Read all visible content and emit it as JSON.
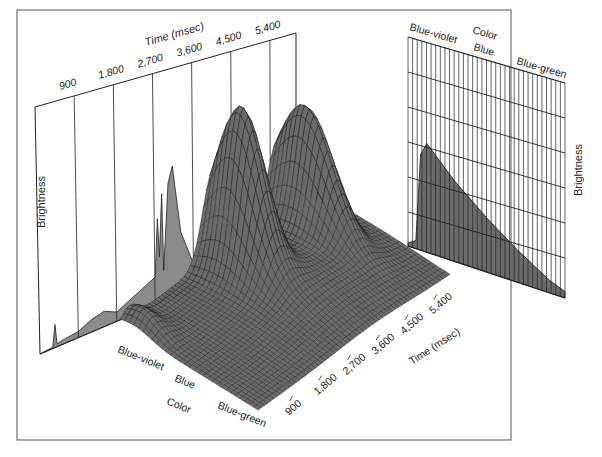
{
  "figure": {
    "frame": {
      "x": 17,
      "y": 10,
      "width": 494,
      "height": 430,
      "stroke": "#555555"
    },
    "colors": {
      "fill": "#8a8a8a",
      "mesh_fill": "#6b6b6b",
      "line": "#222222",
      "background": "#ffffff"
    }
  },
  "chart_data": [
    {
      "type": "area",
      "name": "time-projection",
      "title": "",
      "xlabel": "Time (msec)",
      "ylabel": "Brightness",
      "x_ticks": [
        "900",
        "1,800",
        "2,700",
        "3,600",
        "4,500",
        "5,400"
      ],
      "xlim": [
        0,
        6000
      ],
      "grid": "vertical lines at ticks",
      "x": [
        0,
        300,
        350,
        400,
        600,
        900,
        1200,
        1500,
        1800,
        2100,
        2400,
        2700,
        2750,
        2800,
        2850,
        2900,
        3000,
        3100,
        3300,
        3600,
        3800,
        4000,
        4200,
        4300,
        4400,
        4600,
        4800,
        4900,
        5000,
        5100,
        5200,
        5400,
        5600,
        5800,
        6000
      ],
      "values": [
        0,
        1,
        15,
        2,
        3,
        4,
        8,
        10,
        6,
        10,
        14,
        18,
        55,
        30,
        70,
        20,
        75,
        85,
        40,
        16,
        18,
        30,
        28,
        35,
        18,
        22,
        60,
        85,
        70,
        40,
        48,
        38,
        30,
        26,
        28
      ]
    },
    {
      "type": "area",
      "name": "color-projection",
      "title": "",
      "xlabel": "Color",
      "ylabel": "Brightness",
      "x_ticks": [
        "Blue-violet",
        "Blue",
        "Blue-green"
      ],
      "grid": "dense vertical + horizontal",
      "x": [
        0,
        0.05,
        0.08,
        0.12,
        0.2,
        0.3,
        0.4,
        0.5,
        0.6,
        0.7,
        0.8,
        0.9,
        1.0
      ],
      "values": [
        2,
        5,
        60,
        68,
        60,
        50,
        42,
        34,
        27,
        20,
        14,
        8,
        4
      ]
    },
    {
      "type": "surface",
      "name": "3d-surface",
      "title": "",
      "xlabel": "Time (msec)",
      "ylabel": "Color",
      "zlabel": "Brightness",
      "x_ticks": [
        "900",
        "1,800",
        "2,700",
        "3,600",
        "4,500",
        "5,400"
      ],
      "y_ticks": [
        "Blue-violet",
        "Blue",
        "Blue-green"
      ],
      "peaks": [
        {
          "time": 300,
          "color": "Blue-violet",
          "height": 15
        },
        {
          "time": 2800,
          "color": "Blue-violet",
          "height": 70
        },
        {
          "time": 3100,
          "color": "Blue-violet",
          "height": 85
        },
        {
          "time": 4900,
          "color": "Blue-violet",
          "height": 90
        }
      ]
    }
  ],
  "labels": {
    "left_panel": {
      "axis_title": "Time (msec)",
      "ticks": [
        "900",
        "1,800",
        "2,700",
        "3,600",
        "4,500",
        "5,400"
      ],
      "ylabel": "Brightness"
    },
    "right_panel": {
      "axis_title": "Color",
      "ticks": [
        "Blue-violet",
        "Blue",
        "Blue-green"
      ],
      "ylabel": "Brightness"
    },
    "surface": {
      "time_title": "Time (msec)",
      "time_ticks": [
        "900",
        "1,800",
        "2,700",
        "3,600",
        "4,500",
        "5,400"
      ],
      "color_title": "Color",
      "color_ticks": [
        "Blue-violet",
        "Blue",
        "Blue-green"
      ]
    }
  }
}
